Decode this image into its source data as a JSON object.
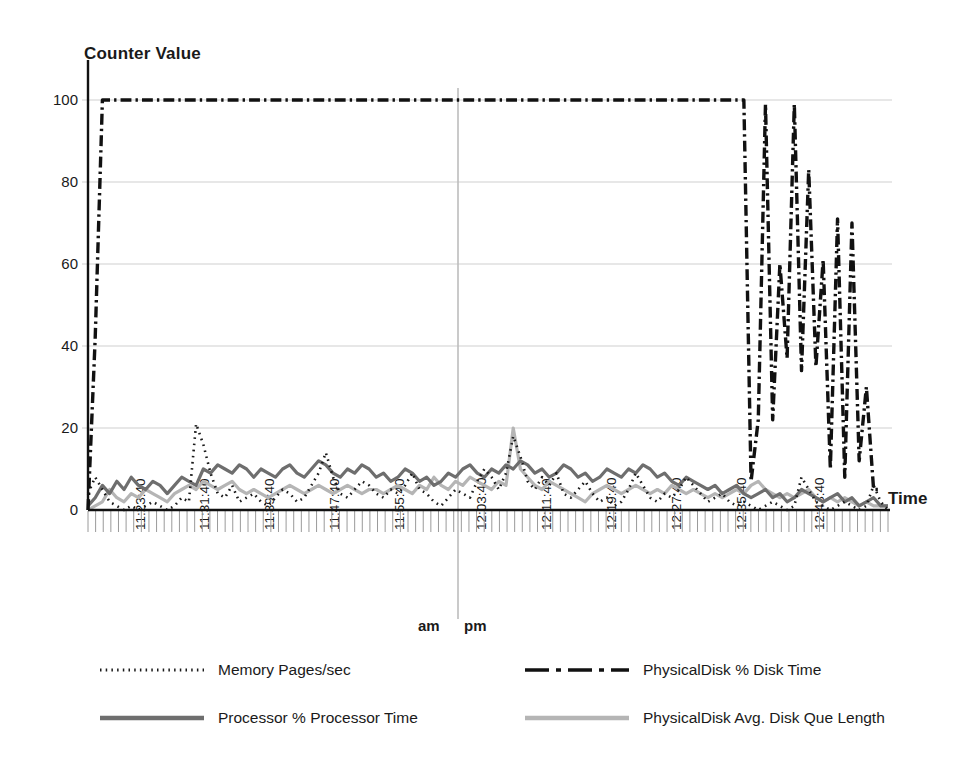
{
  "chart_data": {
    "type": "line",
    "title": "",
    "ylabel": "Counter Value",
    "xlabel": "Time",
    "ylim": [
      0,
      100
    ],
    "yticks": [
      0,
      20,
      40,
      60,
      80,
      100
    ],
    "grid": true,
    "legend_position": "bottom",
    "xlabel_groups": [
      "am",
      "pm"
    ],
    "x_tick_labels": [
      "11:23:40",
      "11:31:40",
      "11:39:40",
      "11:47:40",
      "11:55:40",
      "12:03:40",
      "12:11:40",
      "12:19:40",
      "12:27:40",
      "12:35:40",
      "12:43:40"
    ],
    "x_minor_tick_count": 105,
    "series": [
      {
        "name": "Memory Pages/sec",
        "style": "dotted",
        "color": "#1a1a1a",
        "width": 2.6,
        "values": [
          4,
          8,
          5,
          2,
          1,
          0,
          1,
          0,
          1,
          2,
          1,
          0,
          1,
          3,
          2,
          21,
          16,
          9,
          4,
          3,
          6,
          2,
          3,
          4,
          2,
          1,
          3,
          5,
          4,
          2,
          3,
          6,
          9,
          14,
          8,
          4,
          3,
          5,
          7,
          6,
          4,
          3,
          5,
          4,
          6,
          9,
          5,
          4,
          2,
          1,
          3,
          5,
          4,
          3,
          7,
          10,
          8,
          5,
          9,
          18,
          13,
          7,
          5,
          8,
          6,
          9,
          4,
          3,
          5,
          7,
          4,
          2,
          3,
          1,
          2,
          5,
          9,
          6,
          3,
          2,
          4,
          3,
          5,
          8,
          6,
          4,
          2,
          3,
          4,
          2,
          1,
          2,
          1,
          0,
          1,
          2,
          1,
          0,
          1,
          8,
          5,
          2,
          1,
          0,
          1,
          2,
          1,
          0,
          1,
          6,
          2,
          0
        ]
      },
      {
        "name": "Processor % Processor Time",
        "style": "solid",
        "color": "#6e6e6e",
        "width": 3.2,
        "values": [
          1,
          3,
          6,
          4,
          7,
          5,
          8,
          6,
          5,
          7,
          6,
          4,
          6,
          8,
          7,
          6,
          10,
          9,
          11,
          10,
          9,
          11,
          10,
          8,
          10,
          9,
          8,
          10,
          11,
          9,
          8,
          10,
          12,
          11,
          9,
          8,
          10,
          9,
          11,
          10,
          8,
          9,
          7,
          8,
          10,
          9,
          7,
          8,
          6,
          7,
          9,
          8,
          10,
          11,
          9,
          8,
          10,
          9,
          11,
          10,
          12,
          11,
          9,
          10,
          8,
          9,
          11,
          10,
          8,
          9,
          7,
          8,
          10,
          9,
          8,
          10,
          9,
          11,
          10,
          8,
          9,
          7,
          6,
          8,
          7,
          6,
          5,
          6,
          4,
          5,
          6,
          4,
          3,
          4,
          5,
          3,
          4,
          2,
          3,
          5,
          4,
          3,
          2,
          3,
          4,
          2,
          3,
          1,
          2,
          3,
          1,
          1
        ]
      },
      {
        "name": "PhysicalDisk % Disk Time",
        "style": "dashdot",
        "color": "#111111",
        "width": 3.4,
        "values": [
          0,
          42,
          100,
          100,
          100,
          100,
          100,
          100,
          100,
          100,
          100,
          100,
          100,
          100,
          100,
          100,
          100,
          100,
          100,
          100,
          100,
          100,
          100,
          100,
          100,
          100,
          100,
          100,
          100,
          100,
          100,
          100,
          100,
          100,
          100,
          100,
          100,
          100,
          100,
          100,
          100,
          100,
          100,
          100,
          100,
          100,
          100,
          100,
          100,
          100,
          100,
          100,
          100,
          100,
          100,
          100,
          100,
          100,
          100,
          100,
          100,
          100,
          100,
          100,
          100,
          100,
          100,
          100,
          100,
          100,
          100,
          100,
          100,
          100,
          100,
          100,
          100,
          100,
          100,
          100,
          100,
          100,
          100,
          100,
          100,
          100,
          100,
          100,
          100,
          100,
          100,
          100,
          7,
          22,
          99,
          22,
          60,
          37,
          99,
          34,
          83,
          35,
          61,
          10,
          71,
          8,
          70,
          12,
          30,
          5,
          5
        ]
      },
      {
        "name": "PhysicalDisk Avg. Disk Que Length",
        "style": "solid",
        "color": "#b5b5b5",
        "width": 3.2,
        "values": [
          0,
          1,
          2,
          5,
          3,
          2,
          4,
          3,
          5,
          4,
          3,
          2,
          4,
          5,
          6,
          5,
          7,
          6,
          5,
          6,
          7,
          5,
          4,
          5,
          4,
          3,
          4,
          5,
          6,
          5,
          4,
          5,
          6,
          5,
          4,
          5,
          6,
          5,
          4,
          5,
          5,
          4,
          5,
          6,
          5,
          4,
          6,
          5,
          8,
          6,
          5,
          7,
          6,
          8,
          7,
          6,
          5,
          7,
          6,
          20,
          10,
          8,
          6,
          5,
          7,
          6,
          5,
          4,
          3,
          2,
          4,
          5,
          6,
          5,
          4,
          5,
          6,
          5,
          4,
          5,
          4,
          6,
          5,
          4,
          5,
          4,
          3,
          4,
          3,
          4,
          5,
          4,
          6,
          7,
          5,
          4,
          3,
          4,
          3,
          4,
          5,
          3,
          2,
          3,
          2,
          3,
          2,
          1,
          2,
          1,
          1,
          1
        ]
      }
    ]
  },
  "axis": {
    "y_title": "Counter Value",
    "x_title": "Time",
    "ytick_labels": [
      "100",
      "80",
      "60",
      "40",
      "20",
      "0"
    ],
    "ampm_left": "am",
    "ampm_right": "pm"
  },
  "legend": {
    "items": [
      {
        "label": "Memory Pages/sec",
        "style": "dotted",
        "color": "#1a1a1a"
      },
      {
        "label": "PhysicalDisk % Disk Time",
        "style": "dashdot",
        "color": "#111111"
      },
      {
        "label": "Processor % Processor Time",
        "style": "solid-dark",
        "color": "#6e6e6e"
      },
      {
        "label": "PhysicalDisk Avg. Disk Que Length",
        "style": "solid-light",
        "color": "#b5b5b5"
      }
    ]
  },
  "colors": {
    "background": "#ffffff",
    "axis": "#111111",
    "gridline": "#cfcfcf",
    "divider": "#bdbdbd",
    "memory": "#1a1a1a",
    "processor": "#6e6e6e",
    "disk_time": "#111111",
    "disk_queue": "#b5b5b5"
  }
}
